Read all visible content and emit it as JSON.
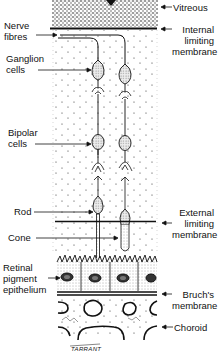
{
  "labels_left": {
    "nerve_fibres": [
      "Nerve",
      "fibres"
    ],
    "ganglion_cells": [
      "Ganglion",
      "cells"
    ],
    "bipolar_cells": [
      "Bipolar",
      "cells"
    ],
    "rod": "Rod",
    "cone": "Cone",
    "rpe": [
      "Retinal",
      "pigment",
      "epithelium"
    ]
  },
  "labels_right": {
    "vitreous": "Vitreous",
    "ilm": [
      "Internal",
      "limiting",
      "membrane"
    ],
    "elm": [
      "External",
      "limiting",
      "membrane"
    ],
    "bruchs": [
      "Bruch's",
      "membrane"
    ],
    "choroid": "Choroid"
  },
  "signature": "TARRANT",
  "colors": {
    "ink": "#111111",
    "background": "#ffffff",
    "stipple": "#333333"
  }
}
